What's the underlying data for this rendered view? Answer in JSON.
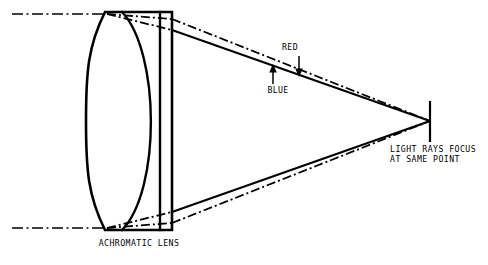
{
  "diagram": {
    "background_color": "#ffffff",
    "line_color": "#000000",
    "labels": {
      "lens": "ACHROMATIC LENS",
      "red_ray": "RED",
      "blue_ray": "BLUE",
      "focus_line1": "LIGHT RAYS FOCUS",
      "focus_line2": "AT SAME POINT"
    },
    "elements": {
      "lens_name": "achromatic-doublet-lens",
      "top_incoming_ray": "parallel-ray-top",
      "bottom_incoming_ray": "parallel-ray-bottom",
      "red_refracted": "red-refracted-ray",
      "blue_refracted": "blue-refracted-ray",
      "focal_point_marker": "focal-point-tick"
    },
    "icons": {
      "red_pointer": "arrow-down-icon",
      "blue_pointer": "arrow-up-icon"
    },
    "geometry": {
      "lens_left_x": 105,
      "lens_right_x": 172,
      "lens_top_y": 12,
      "lens_bottom_y": 230,
      "focus_x": 430,
      "focus_y": 121,
      "axis_top_y": 14,
      "axis_bottom_y": 228
    }
  }
}
